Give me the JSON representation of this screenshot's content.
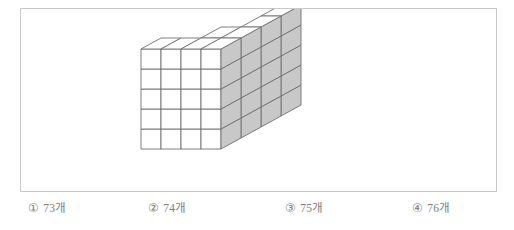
{
  "figure": {
    "name": "isometric-cube-stack",
    "colors": {
      "outline": "#4d4d4d",
      "inner_line": "#6f6f6f",
      "top_face": "#ffffff",
      "front_face": "#ffffff",
      "side_face": "#c8c8c8",
      "frame_border": "#c9c9c9",
      "background": "#ffffff"
    },
    "geometry": {
      "cell": 20,
      "dx": 20,
      "dy": 11,
      "origin_x": 120,
      "origin_y": 40,
      "depth_cols": 4,
      "width_cols": 4,
      "height_rows": 5
    },
    "heights": [
      [
        5,
        5,
        5,
        5
      ],
      [
        4,
        4,
        5,
        5
      ],
      [
        3,
        3,
        4,
        5
      ],
      [
        2,
        3,
        4,
        5
      ]
    ]
  },
  "options": [
    {
      "marker": "①",
      "label": "73개"
    },
    {
      "marker": "②",
      "label": "74개"
    },
    {
      "marker": "③",
      "label": "75개"
    },
    {
      "marker": "④",
      "label": "76개"
    }
  ]
}
